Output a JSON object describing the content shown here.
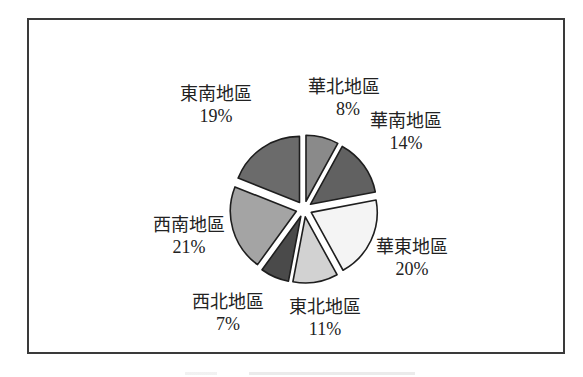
{
  "chart_data": {
    "type": "pie",
    "title": "",
    "exploded": true,
    "start_angle_deg": 0,
    "direction": "clockwise",
    "slices": [
      {
        "label": "華北地區",
        "value": 8,
        "pct_label": "8%",
        "color": "#8a8a8a"
      },
      {
        "label": "華南地區",
        "value": 14,
        "pct_label": "14%",
        "color": "#616161"
      },
      {
        "label": "華東地區",
        "value": 20,
        "pct_label": "20%",
        "color": "#f4f4f4"
      },
      {
        "label": "東北地區",
        "value": 11,
        "pct_label": "11%",
        "color": "#d2d2d2"
      },
      {
        "label": "西北地區",
        "value": 7,
        "pct_label": "7%",
        "color": "#4a4a4a"
      },
      {
        "label": "西南地區",
        "value": 21,
        "pct_label": "21%",
        "color": "#a4a4a4"
      },
      {
        "label": "東南地區",
        "value": 19,
        "pct_label": "19%",
        "color": "#6b6b6b"
      }
    ],
    "legend": "none",
    "data_labels": "category and percent, outside"
  },
  "labels": {
    "huabei": {
      "name": "華北地區",
      "pct": "8%"
    },
    "huanan": {
      "name": "華南地區",
      "pct": "14%"
    },
    "huadong": {
      "name": "華東地區",
      "pct": "20%"
    },
    "dongbei": {
      "name": "東北地區",
      "pct": "11%"
    },
    "xibei": {
      "name": "西北地區",
      "pct": "7%"
    },
    "xinan": {
      "name": "西南地區",
      "pct": "21%"
    },
    "dongnan": {
      "name": "東南地區",
      "pct": "19%"
    }
  }
}
